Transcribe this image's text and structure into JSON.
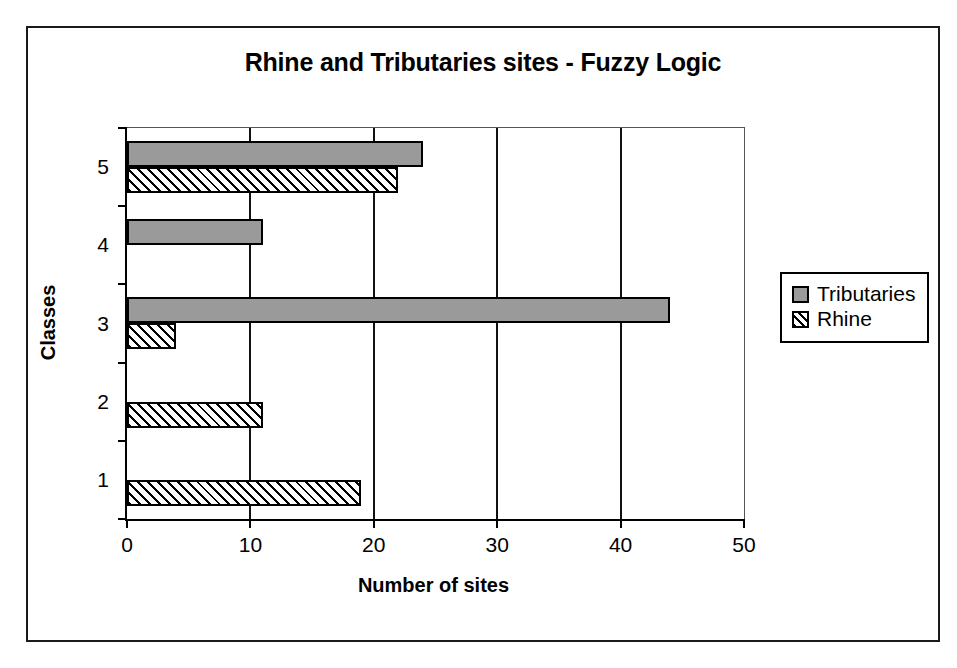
{
  "chart_data": {
    "type": "bar",
    "orientation": "horizontal",
    "title": "Rhine and Tributaries sites - Fuzzy Logic",
    "xlabel": "Number of sites",
    "ylabel": "Classes",
    "categories": [
      "1",
      "2",
      "3",
      "4",
      "5"
    ],
    "xlim": [
      0,
      50
    ],
    "xticks": [
      0,
      10,
      20,
      30,
      40,
      50
    ],
    "xtick_labels": [
      "0",
      "10",
      "20",
      "30",
      "40",
      "50"
    ],
    "grid": true,
    "grid_axis": "x",
    "legend_position": "right",
    "series": [
      {
        "name": "Tributaries",
        "color": "#9a9a9a",
        "pattern": "solid",
        "values": [
          0,
          0,
          44,
          11,
          24
        ]
      },
      {
        "name": "Rhine",
        "color": "#ffffff",
        "pattern": "diagonal-hatch",
        "values": [
          19,
          11,
          4,
          0,
          22
        ]
      }
    ]
  },
  "figure": {
    "frame_color": "#1a1a1a",
    "background": "#ffffff",
    "axis_color": "#000000"
  }
}
